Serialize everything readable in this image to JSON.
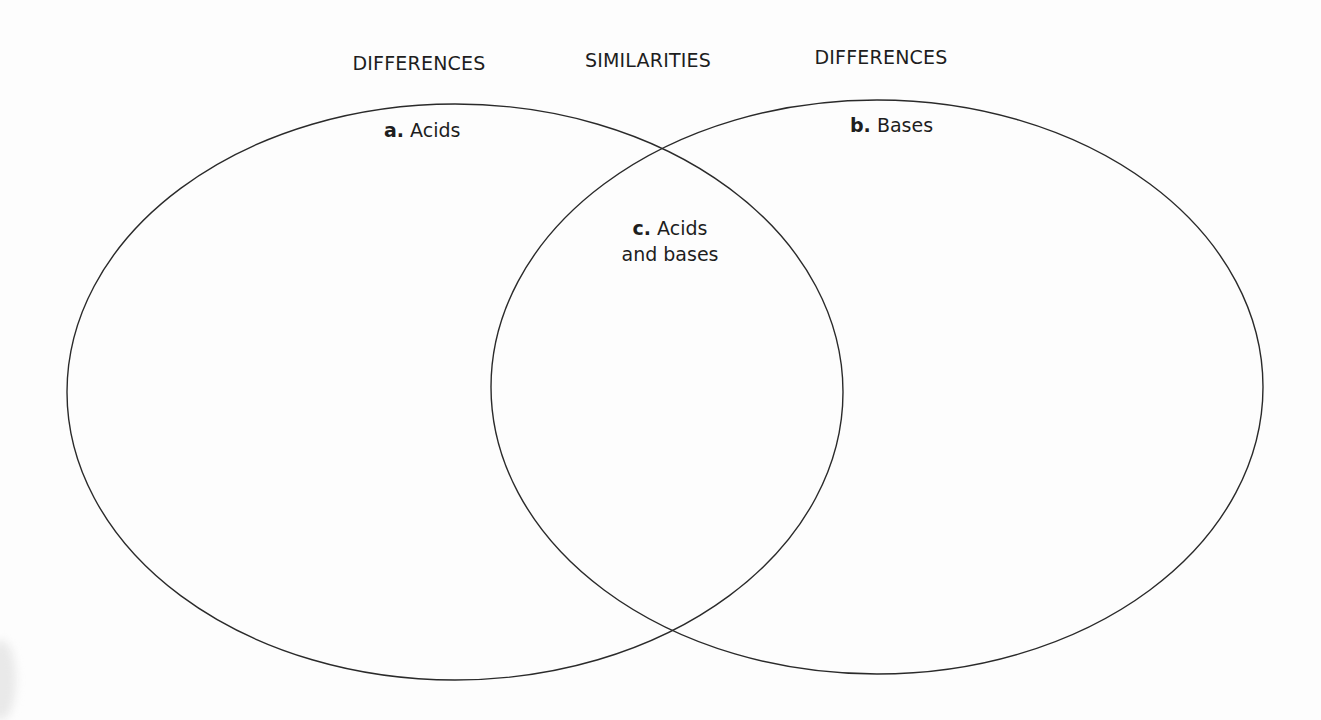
{
  "diagram": {
    "type": "venn",
    "headers": {
      "left": "DIFFERENCES",
      "middle": "SIMILARITIES",
      "right": "DIFFERENCES"
    },
    "sets": [
      {
        "letter": "a.",
        "label": "Acids",
        "cx": 455,
        "cy": 392,
        "rx": 388,
        "ry": 288
      },
      {
        "letter": "b.",
        "label": "Bases",
        "cx": 877,
        "cy": 387,
        "rx": 386,
        "ry": 287
      }
    ],
    "intersection": {
      "letter": "c.",
      "line1": "Acids",
      "line2": "and bases"
    },
    "stroke_color": "#2a2a2a",
    "background": "#fdfdfd"
  }
}
